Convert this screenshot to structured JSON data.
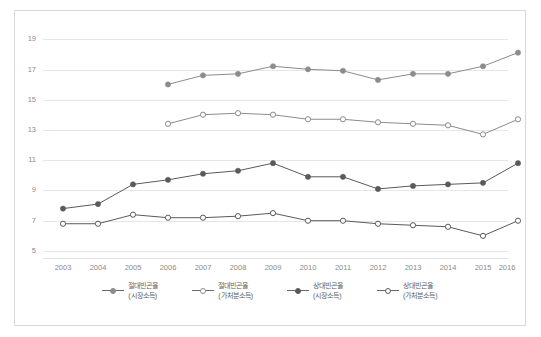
{
  "chart_data": {
    "type": "line",
    "title": "",
    "xlabel": "",
    "ylabel": "",
    "x": [
      2003,
      2004,
      2005,
      2006,
      2007,
      2008,
      2009,
      2010,
      2011,
      2012,
      2013,
      2014,
      2015,
      2016
    ],
    "xticklabels": [
      "2003",
      "2004",
      "2005",
      "2006",
      "2007",
      "2008",
      "2009",
      "2010",
      "2011",
      "2012",
      "2013",
      "2014",
      "2015",
      "2016"
    ],
    "yticklabels": [
      "19",
      "17",
      "15",
      "13",
      "11",
      "9",
      "7",
      "5"
    ],
    "ytickvalues": [
      19,
      17,
      15,
      13,
      11,
      9,
      7,
      5
    ],
    "ylim": [
      5,
      19
    ],
    "grid": true,
    "legend_position": "bottom",
    "series": [
      {
        "name": "절대빈곤율 (시장소득)",
        "name_line1": "절대빈곤율",
        "name_line2": "(시장소득)",
        "marker": "filled-circle",
        "color": "#8c8c8c",
        "values": [
          null,
          null,
          null,
          16.0,
          16.6,
          16.7,
          17.2,
          17.0,
          16.9,
          16.3,
          16.7,
          16.7,
          17.2,
          18.1
        ]
      },
      {
        "name": "절대빈곤율 (가처분소득)",
        "name_line1": "절대빈곤율",
        "name_line2": "(가처분소득)",
        "marker": "hollow-circle",
        "color": "#8c8c8c",
        "values": [
          null,
          null,
          null,
          13.4,
          14.0,
          14.1,
          14.0,
          13.7,
          13.7,
          13.5,
          13.4,
          13.3,
          12.7,
          13.7
        ]
      },
      {
        "name": "상대빈곤율 (시장소득)",
        "name_line1": "상대빈곤율",
        "name_line2": "(시장소득)",
        "marker": "filled-circle",
        "color": "#5a5a5a",
        "values": [
          7.8,
          8.1,
          9.4,
          9.7,
          10.1,
          10.3,
          10.8,
          9.9,
          9.9,
          9.1,
          9.3,
          9.4,
          9.5,
          10.8
        ]
      },
      {
        "name": "상대빈곤율 (가처분소득)",
        "name_line1": "상대빈곤율",
        "name_line2": "(가처분소득)",
        "marker": "hollow-circle",
        "color": "#5a5a5a",
        "values": [
          6.8,
          6.8,
          7.4,
          7.2,
          7.2,
          7.3,
          7.5,
          7.0,
          7.0,
          6.8,
          6.7,
          6.6,
          6.0,
          7.0
        ]
      }
    ]
  }
}
